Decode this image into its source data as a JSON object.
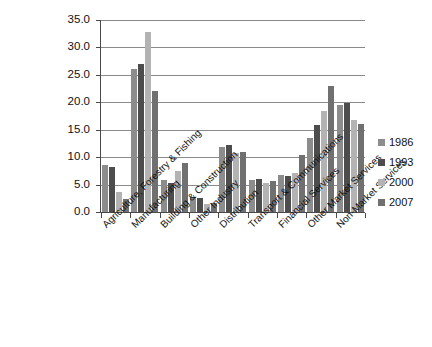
{
  "chart_data": {
    "type": "bar",
    "title": "",
    "xlabel": "",
    "ylabel": "",
    "ylim": [
      0.0,
      35.0
    ],
    "grid": true,
    "legend_position": "right",
    "y_ticks": [
      "0.0",
      "5.0",
      "10.0",
      "15.0",
      "20.0",
      "25.0",
      "30.0",
      "35.0"
    ],
    "categories": [
      "Agriculture, Forestry & Fishing",
      "Manufacturing",
      "Building & Construction",
      "Other Industry",
      "Distribution",
      "Transport & Communications",
      "Financial Services",
      "Other Market Services",
      "Non-Market Services"
    ],
    "series": [
      {
        "name": "1986",
        "color": "#8c8c8c",
        "values": [
          8.6,
          26.0,
          5.8,
          2.8,
          11.8,
          5.8,
          6.8,
          13.5,
          19.5
        ]
      },
      {
        "name": "1993",
        "color": "#4d4d4d",
        "values": [
          8.2,
          26.9,
          5.2,
          2.5,
          12.2,
          6.1,
          6.6,
          15.8,
          19.8
        ]
      },
      {
        "name": "2000",
        "color": "#b3b3b3",
        "values": [
          3.7,
          32.8,
          7.5,
          1.4,
          10.8,
          5.3,
          7.2,
          18.5,
          16.8
        ]
      },
      {
        "name": "2007",
        "color": "#707070",
        "values": [
          2.3,
          22.0,
          9.0,
          1.6,
          11.0,
          5.6,
          10.4,
          23.0,
          16.0
        ]
      }
    ]
  },
  "legend": {
    "items": [
      {
        "label": "1986"
      },
      {
        "label": "1993"
      },
      {
        "label": "2000"
      },
      {
        "label": "2007"
      }
    ]
  }
}
